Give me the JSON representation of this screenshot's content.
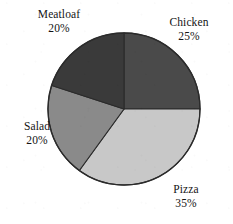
{
  "chart_data": {
    "type": "pie",
    "title": "",
    "subtitle": "",
    "xlabel": "",
    "ylabel": "",
    "legend_position": "none",
    "grid": false,
    "label_format": "name + percent, two lines, outside slice",
    "start_angle_deg": 0,
    "direction": "clockwise",
    "categories": [
      "Chicken",
      "Pizza",
      "Salad",
      "Meatloaf"
    ],
    "values": [
      25,
      35,
      20,
      20
    ],
    "units": "percent",
    "total": 100,
    "slices": [
      {
        "name": "Chicken",
        "value": 25,
        "value_label": "25%",
        "color": "#4a4a4a",
        "start_angle_deg": 0,
        "end_angle_deg": 90,
        "label_position": "top-right"
      },
      {
        "name": "Pizza",
        "value": 35,
        "value_label": "35%",
        "color": "#c8c8c8",
        "start_angle_deg": 90,
        "end_angle_deg": 216,
        "label_position": "bottom-right"
      },
      {
        "name": "Salad",
        "value": 20,
        "value_label": "20%",
        "color": "#8a8a8a",
        "start_angle_deg": 216,
        "end_angle_deg": 288,
        "label_position": "left"
      },
      {
        "name": "Meatloaf",
        "value": 20,
        "value_label": "20%",
        "color": "#3a3a3a",
        "start_angle_deg": 288,
        "end_angle_deg": 360,
        "label_position": "top-left"
      }
    ],
    "geometry": {
      "center_x": 124,
      "center_y": 109,
      "radius": 76
    },
    "colors": {
      "background": "#ffffff",
      "outline": "#2b2b2b",
      "text": "#141414"
    }
  },
  "labels": {
    "meatloaf": {
      "name": "Meatloaf",
      "value": "20%"
    },
    "chicken": {
      "name": "Chicken",
      "value": "25%"
    },
    "salad": {
      "name": "Salad",
      "value": "20%"
    },
    "pizza": {
      "name": "Pizza",
      "value": "35%"
    }
  }
}
